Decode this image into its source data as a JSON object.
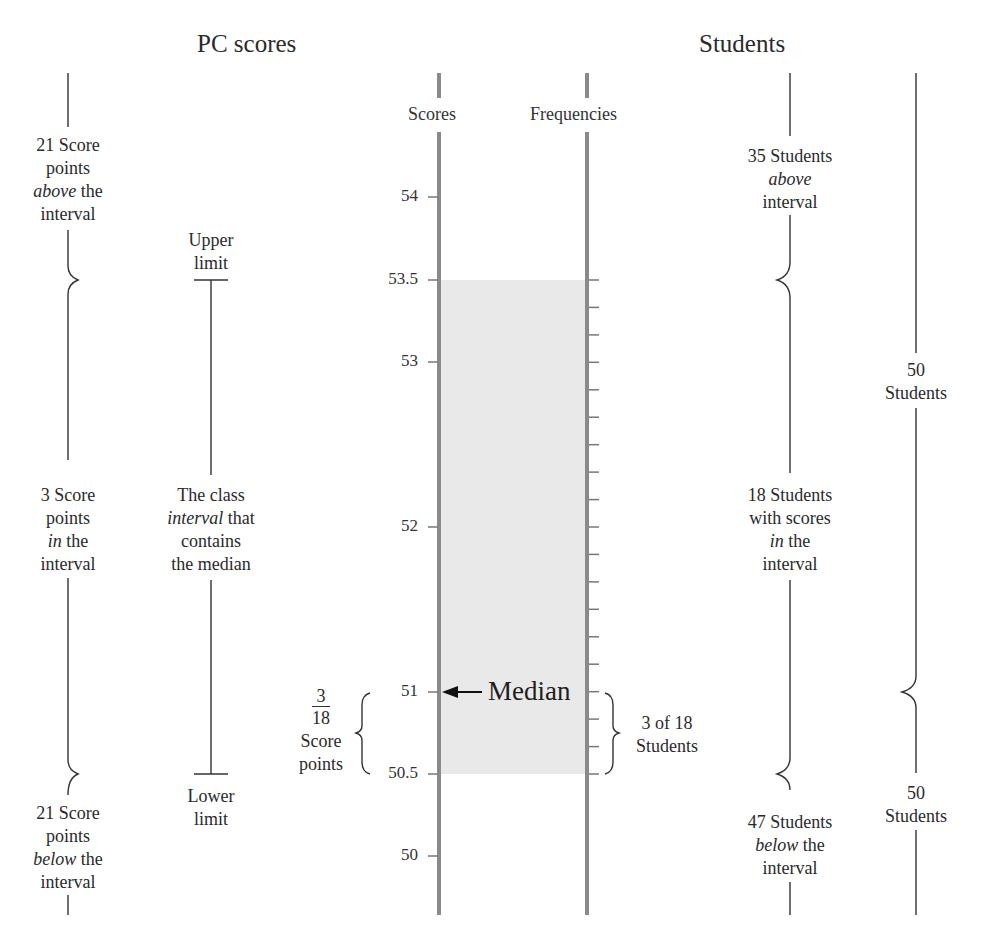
{
  "headers": {
    "left": "PC scores",
    "right": "Students"
  },
  "axes": {
    "scores_label": "Scores",
    "frequencies_label": "Frequencies",
    "axis_color": "#8a8a8a",
    "shade_color": "#e9e9e9"
  },
  "score_ticks": [
    {
      "label": "54",
      "value": 54
    },
    {
      "label": "53.5",
      "value": 53.5
    },
    {
      "label": "53",
      "value": 53
    },
    {
      "label": "52",
      "value": 52
    },
    {
      "label": "51",
      "value": 51
    },
    {
      "label": "50.5",
      "value": 50.5
    },
    {
      "label": "50",
      "value": 50
    }
  ],
  "left_column": {
    "above": {
      "line1": "21 Score",
      "line2": "points",
      "line3_em": "above",
      "line3_rest": " the",
      "line4": "interval"
    },
    "in": {
      "line1": "3 Score",
      "line2": "points",
      "line3_em": "in",
      "line3_rest": " the",
      "line4": "interval"
    },
    "below": {
      "line1": "21 Score",
      "line2": "points",
      "line3_em": "below",
      "line3_rest": " the",
      "line4": "interval"
    }
  },
  "limits_column": {
    "upper": {
      "line1": "Upper",
      "line2": "limit"
    },
    "middle": {
      "line1": "The class",
      "line2_em": "interval",
      "line2_rest": " that",
      "line3": "contains",
      "line4": "the median"
    },
    "lower": {
      "line1": "Lower",
      "line2": "limit"
    }
  },
  "median": {
    "label": "Median",
    "value": 51,
    "fraction_num": "3",
    "fraction_den": "18",
    "fraction_line1": "Score",
    "fraction_line2": "points",
    "freq_line1": "3 of 18",
    "freq_line2": "Students"
  },
  "students_column": {
    "above": {
      "line1": "35 Students",
      "line2_em": "above",
      "line3": "interval"
    },
    "in": {
      "line1": "18 Students",
      "line2": "with scores",
      "line3_em": "in",
      "line3_rest": " the",
      "line4": "interval"
    },
    "below": {
      "line1": "47 Students",
      "line2_em": "below",
      "line2_rest": " the",
      "line3": "interval"
    }
  },
  "totals_column": {
    "upper": {
      "line1": "50",
      "line2": "Students"
    },
    "lower": {
      "line1": "50",
      "line2": "Students"
    }
  },
  "interval": {
    "lower_limit": 50.5,
    "upper_limit": 53.5,
    "frequency": 18,
    "students_above": 35,
    "students_below": 47,
    "total_students": 100
  }
}
